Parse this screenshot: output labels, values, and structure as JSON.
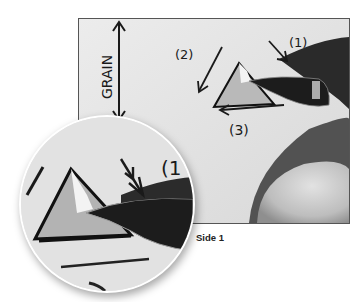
{
  "figure": {
    "caption": "Side 1",
    "annotations": {
      "grain_label": "GRAIN",
      "step1": "(1)",
      "step2": "(2)",
      "step3": "(3)",
      "inset_step1": "(1"
    },
    "colors": {
      "background": "#ffffff",
      "paper": "#e6e6e6",
      "ink": "#1a1a1a",
      "blade": "#1c1c1c",
      "frame_border": "#555555"
    }
  }
}
